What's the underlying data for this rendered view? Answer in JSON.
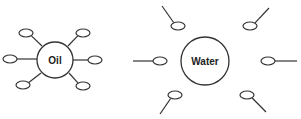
{
  "diagram": {
    "stroke_color": "#333333",
    "background": "#ffffff",
    "oil": {
      "label": "Oil",
      "center": [
        55,
        60
      ],
      "radius": 18,
      "molecules": [
        {
          "id": "ul",
          "head": [
            26,
            33
          ],
          "tail": [
            42,
            46
          ]
        },
        {
          "id": "l",
          "head": [
            10,
            59
          ],
          "tail": [
            37,
            59
          ]
        },
        {
          "id": "ll",
          "head": [
            23,
            85
          ],
          "tail": [
            41,
            73
          ]
        },
        {
          "id": "ur",
          "head": [
            83,
            33
          ],
          "tail": [
            68,
            46
          ]
        },
        {
          "id": "r",
          "head": [
            95,
            60
          ],
          "tail": [
            73,
            60
          ]
        },
        {
          "id": "lr",
          "head": [
            83,
            86
          ],
          "tail": [
            69,
            73
          ]
        }
      ]
    },
    "water": {
      "label": "Water",
      "center": [
        205,
        61
      ],
      "radius": 24,
      "molecules": [
        {
          "id": "ul",
          "head": [
            178,
            26
          ],
          "tail": [
            162,
            6
          ]
        },
        {
          "id": "ur",
          "head": [
            250,
            26
          ],
          "tail": [
            269,
            8
          ]
        },
        {
          "id": "l",
          "head": [
            160,
            61
          ],
          "tail": [
            133,
            61
          ]
        },
        {
          "id": "r",
          "head": [
            268,
            61
          ],
          "tail": [
            297,
            61
          ]
        },
        {
          "id": "ll",
          "head": [
            175,
            95
          ],
          "tail": [
            160,
            114
          ]
        },
        {
          "id": "lr",
          "head": [
            247,
            95
          ],
          "tail": [
            266,
            112
          ]
        }
      ]
    }
  }
}
